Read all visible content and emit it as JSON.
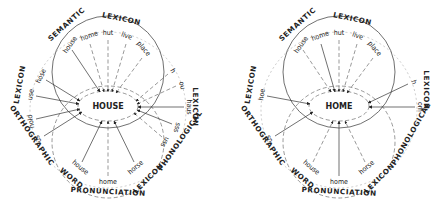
{
  "diagrams": [
    {
      "center_word": "HOUSE",
      "lexicons": {
        "semantic": [
          "SEMANTIC",
          "LEXICON"
        ],
        "orthographic": [
          "LEXICON",
          "ORTHOGRAPHIC"
        ],
        "phonological": [
          "LEXICON",
          "PHONOLOGICAL"
        ],
        "pronunciation": [
          "WORD",
          "PRONUNCIATION",
          "LEXICON"
        ]
      },
      "semantic_words": [
        "house",
        "home",
        "hut",
        "live",
        "place"
      ],
      "orthographic_words": [
        "hose",
        "use",
        "hold",
        "us"
      ],
      "phonological_words": [
        "h",
        "ou",
        "haus",
        "sss",
        "uss"
      ],
      "pronunciation_words": [
        "house",
        "home",
        "horse"
      ]
    },
    {
      "center_word": "HOME",
      "lexicons": {
        "semantic": [
          "SEMANTIC",
          "LEXICON"
        ],
        "orthographic": [
          "LEXICON",
          "ORTHOGRAPHIC"
        ],
        "phonological": [
          "LEXICON",
          "PHONOLOGICAL"
        ],
        "pronunciation": [
          "WORD",
          "PRONUNCIATION",
          "LEXICON"
        ]
      },
      "semantic_words": [
        "house",
        "home",
        "hut",
        "live",
        "place"
      ],
      "orthographic_words": [
        "hoe",
        "us"
      ],
      "phonological_words": [
        "h",
        "om"
      ],
      "pronunciation_words": [
        "house",
        "home",
        "horse"
      ]
    }
  ]
}
